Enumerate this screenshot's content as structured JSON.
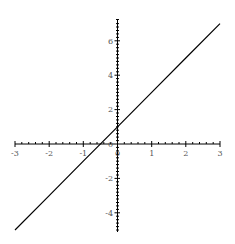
{
  "chart_data": {
    "type": "line",
    "title": "",
    "xlabel": "",
    "ylabel": "",
    "xlim": [
      -3,
      3
    ],
    "ylim": [
      -5.2,
      7.2
    ],
    "grid": false,
    "legend": null,
    "x_ticks": [
      "-3",
      "-2",
      "-1",
      "0",
      "1",
      "2",
      "3"
    ],
    "y_ticks": [
      "-4",
      "-2",
      "0",
      "2",
      "4",
      "6"
    ],
    "series": [
      {
        "name": "y = 2x + 1",
        "x": [
          -3,
          -2,
          -1,
          0,
          1,
          2,
          3
        ],
        "values": [
          -5,
          -3,
          -1,
          1,
          3,
          5,
          7
        ],
        "color": "#000000"
      }
    ]
  },
  "labels": {
    "x": {
      "m3": "-3",
      "m2": "-2",
      "m1": "-1",
      "z": "0",
      "p1": "1",
      "p2": "2",
      "p3": "3"
    },
    "y": {
      "m4": "-4",
      "m2": "-2",
      "z": "0",
      "p2": "2",
      "p4": "4",
      "p6": "6"
    }
  }
}
